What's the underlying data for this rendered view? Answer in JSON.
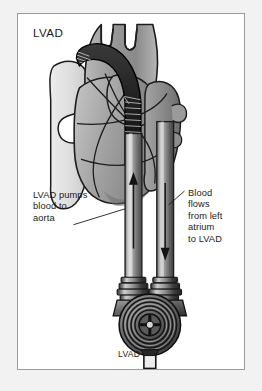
{
  "figure": {
    "title": "LVAD",
    "bottom_label": "LVAD",
    "panel_background": "#ffffff",
    "outer_background": "#f2f2f2",
    "border_color": "#9b9b9b",
    "text_color": "#1b1b1b"
  },
  "annotations": {
    "left": {
      "text": "LVAD pumps\nblood to\naorta",
      "lines": [
        "LVAD pumps",
        "blood to",
        "aorta"
      ]
    },
    "right": {
      "text": "Blood\nflows\nfrom left\natrium\nto LVAD",
      "lines": [
        "Blood",
        "flows",
        "from left",
        "atrium",
        "to LVAD"
      ]
    }
  },
  "diagram": {
    "type": "medical-illustration",
    "parts": [
      {
        "name": "aorta",
        "description": "ascending aorta and aortic arch with brachiocephalic branch vessels at top"
      },
      {
        "name": "heart",
        "description": "heart body shown in grayscale with ventricles and coronary vessels"
      },
      {
        "name": "outflow-graft",
        "description": "corrugated ribbed tube arcing from pump over the heart into the aorta"
      },
      {
        "name": "outflow-cannula",
        "description": "left vertical tube carrying blood upward from pump to aorta",
        "flow_direction": "up"
      },
      {
        "name": "inflow-cannula",
        "description": "right vertical tube carrying blood downward from left atrium to pump",
        "flow_direction": "down"
      },
      {
        "name": "pump",
        "description": "concentric ring centrifugal pump housing with cross-shaped impeller hub"
      },
      {
        "name": "drive-line",
        "description": "percutaneous drive line exiting bottom of pump"
      }
    ],
    "colors": {
      "tissue_light": "#d8d8d8",
      "tissue_mid": "#a9a9a9",
      "tissue_dark": "#707070",
      "device_dark": "#2b2b2b",
      "device_mid": "#8c8c8c",
      "outline": "#1c1c1c"
    }
  }
}
